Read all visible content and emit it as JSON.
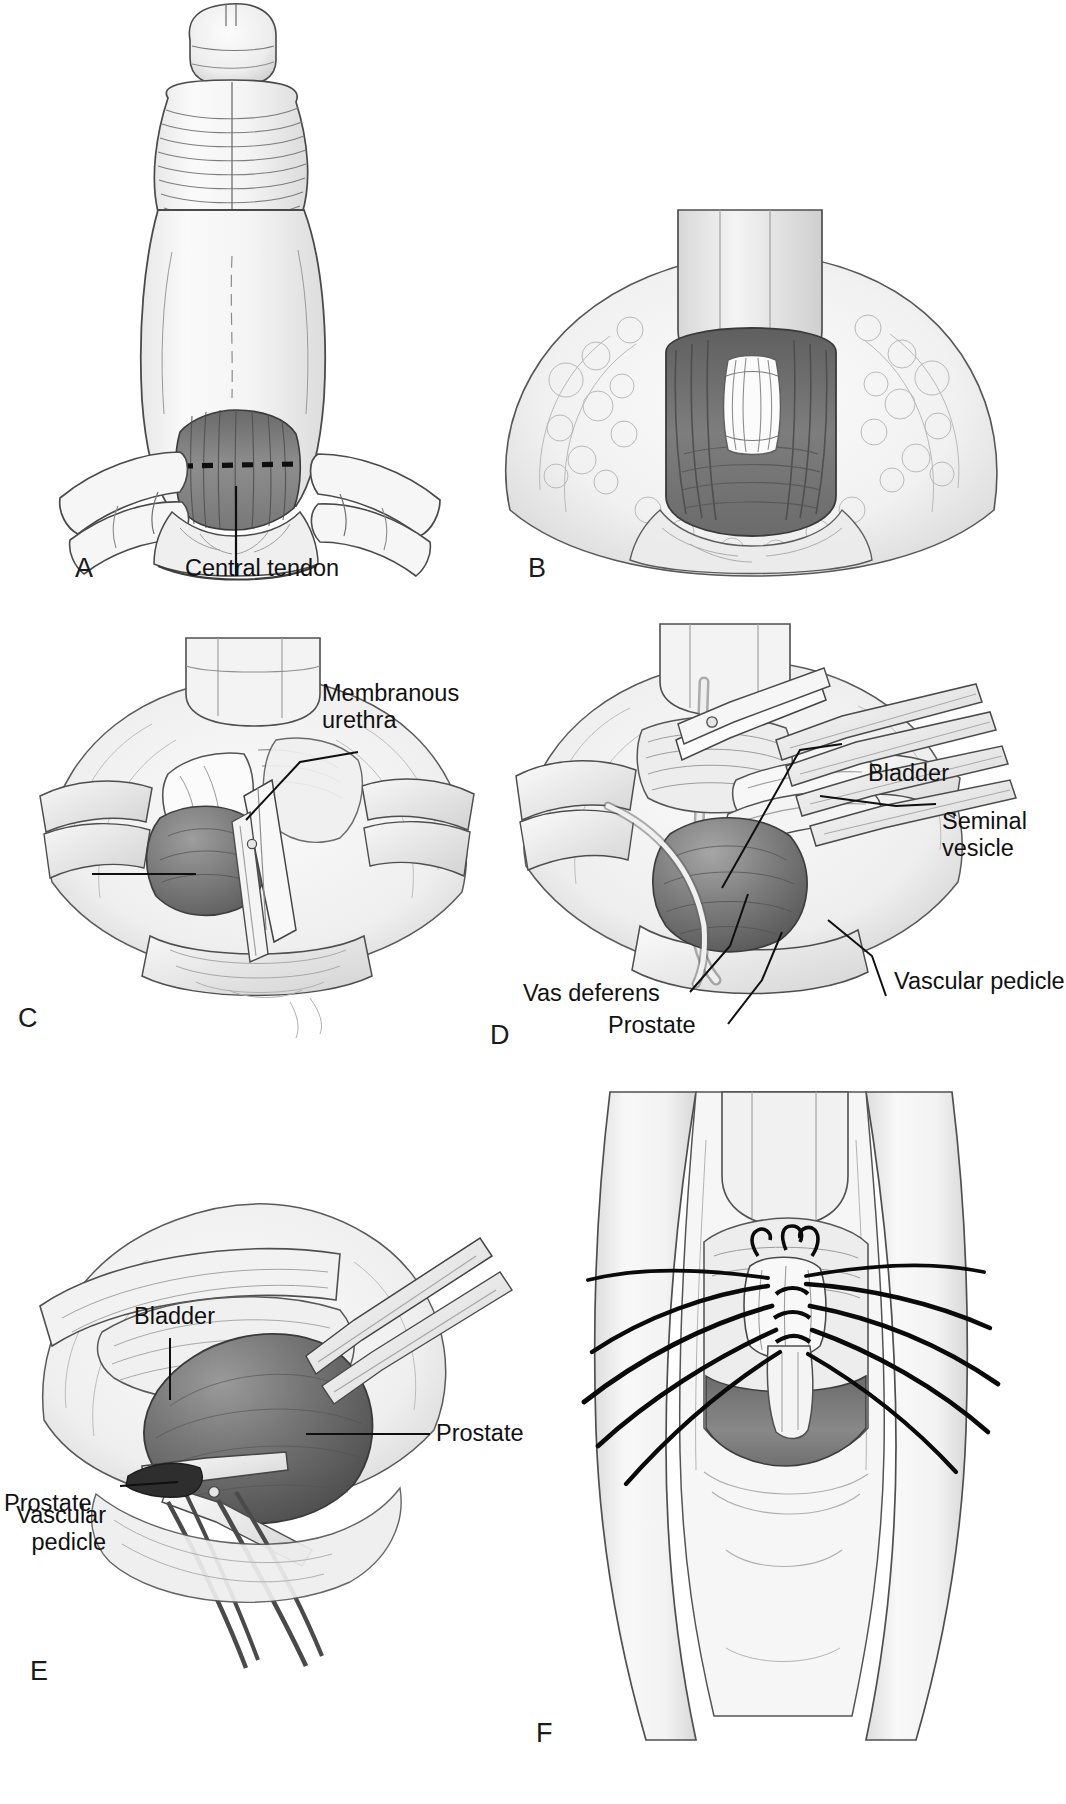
{
  "figure": {
    "background_color": "#ffffff",
    "ink_color": "#1a1a1a",
    "tissue_light": "#f2f2f2",
    "tissue_mid": "#c9c9c9",
    "tissue_dark": "#8f8f8f",
    "organ_dark": "#6f6f6f"
  },
  "panels": [
    {
      "letter": "A",
      "caption": "Perineal exposure with central tendon and dashed incision line",
      "labels": [
        {
          "id": "central-tendon",
          "text": "Central tendon"
        }
      ]
    },
    {
      "letter": "B",
      "caption": "Central tendon divided, rectourethralis exposed",
      "labels": []
    },
    {
      "letter": "C",
      "caption": "Membranous urethra divided at prostatic apex",
      "labels": [
        {
          "id": "membranous-urethra",
          "text": "Membranous\nurethra"
        },
        {
          "id": "prostate",
          "text": "Prostate"
        }
      ]
    },
    {
      "letter": "D",
      "caption": "Bladder neck divided, seminal vesicles and vasa mobilized",
      "labels": [
        {
          "id": "bladder",
          "text": "Bladder"
        },
        {
          "id": "seminal-vesicle",
          "text": "Seminal\nvesicle"
        },
        {
          "id": "vas-deferens",
          "text": "Vas deferens"
        },
        {
          "id": "prostate",
          "text": "Prostate"
        },
        {
          "id": "vascular-pedicle",
          "text": "Vascular pedicle"
        }
      ]
    },
    {
      "letter": "E",
      "caption": "Lateral vascular pedicle ligated and divided",
      "labels": [
        {
          "id": "bladder",
          "text": "Bladder"
        },
        {
          "id": "vascular-pedicle",
          "text": "Vascular\npedicle"
        },
        {
          "id": "prostate",
          "text": "Prostate"
        }
      ]
    },
    {
      "letter": "F",
      "caption": "Vesicourethral anastomosis sutures placed",
      "labels": []
    }
  ],
  "label_lines": {
    "central_tendon_leader": "vertical leader from central tendon to label",
    "membranous_urethra_leader": "diagonal leader",
    "prostate_c_leader": "horizontal leader",
    "bladder_d_leader": "diagonal leader",
    "seminal_vesicle_leader": "diagonal leader",
    "vas_deferens_leader": "diagonal leader",
    "prostate_d_leader": "diagonal leader",
    "vascular_pedicle_d_leader": "diagonal leader",
    "bladder_e_leader": "vertical leader",
    "vascular_pedicle_e_leader": "horizontal leader",
    "prostate_e_leader": "horizontal leader"
  }
}
